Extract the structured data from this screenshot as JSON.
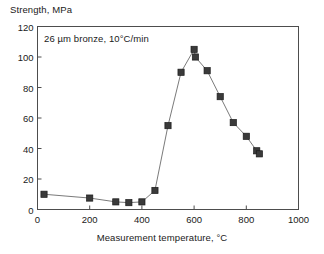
{
  "chart_data": {
    "type": "line",
    "title": "",
    "ylabel": "Strength, MPa",
    "xlabel": "Measurement temperature, °C",
    "annotation": "26 µm bronze, 10°C/min",
    "xlim": [
      0,
      1000
    ],
    "ylim": [
      0,
      120
    ],
    "xticks": [
      0,
      200,
      400,
      600,
      800,
      1000
    ],
    "yticks": [
      0,
      20,
      40,
      60,
      80,
      100,
      120
    ],
    "xtick_labels": [
      "0",
      "200",
      "400",
      "600",
      "800",
      "1000"
    ],
    "ytick_labels": [
      "0",
      "20",
      "40",
      "60",
      "80",
      "100",
      "120"
    ],
    "grid": false,
    "legend": null,
    "marker": "square",
    "marker_color": "#3a3a3a",
    "line_color": "#6b6b6b",
    "series": [
      {
        "name": "26 µm bronze, 10°C/min",
        "x": [
          25,
          200,
          300,
          350,
          400,
          450,
          500,
          550,
          600,
          605,
          650,
          700,
          750,
          800,
          840,
          850
        ],
        "y": [
          10,
          7.5,
          5,
          4.5,
          5,
          12.5,
          55,
          90,
          105,
          100,
          91,
          74,
          57,
          48,
          38.5,
          36.5
        ]
      }
    ]
  }
}
